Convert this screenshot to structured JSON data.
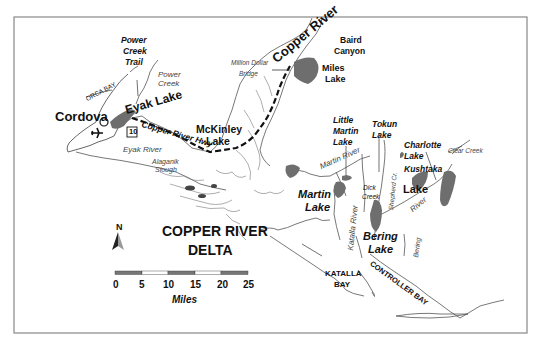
{
  "map": {
    "title": "COPPER RIVER DELTA",
    "title_line1": "COPPER RIVER",
    "title_line2": "DELTA",
    "north_arrow": "N",
    "scale_bar": {
      "ticks": [
        "0",
        "5",
        "10",
        "15",
        "20",
        "25"
      ],
      "unit": "Miles",
      "segment_colors": [
        "#777777",
        "#ffffff",
        "#777777",
        "#ffffff",
        "#777777"
      ]
    },
    "places": {
      "cordova": "Cordova",
      "eyak_lake": "Eyak Lake",
      "orca_bay": "ORCA BAY",
      "power_creek_trail_1": "Power",
      "power_creek_trail_2": "Creek",
      "power_creek_trail_3": "Trail",
      "power_creek_1": "Power",
      "power_creek_2": "Creek",
      "copper_river": "Copper River",
      "baird_canyon_1": "Baird",
      "baird_canyon_2": "Canyon",
      "million_dollar_bridge_1": "Million Dollar",
      "million_dollar_bridge_2": "Bridge",
      "miles_lake_1": "Miles",
      "miles_lake_2": "Lake",
      "mckinley_lake_1": "McKinley",
      "mckinley_lake_2": "Lake",
      "highway_number": "10",
      "copper_river_hwy": "Copper River Hwy",
      "eyak_river": "Eyak River",
      "alaganik_slough_1": "Alaganik",
      "alaganik_slough_2": "Slough",
      "little_martin_lake_1": "Little",
      "little_martin_lake_2": "Martin",
      "little_martin_lake_3": "Lake",
      "tokun_lake_1": "Tokun",
      "tokun_lake_2": "Lake",
      "charlotte_lake_1": "Charlotte",
      "charlotte_lake_2": "Lake",
      "clear_creek": "Clear Creek",
      "martin_river": "Martin River",
      "kushtaka_lake_1": "Kushtaka",
      "kushtaka_lake_2": "Lake",
      "martin_lake_1": "Martin",
      "martin_lake_2": "Lake",
      "dick_creek_1": "Dick",
      "dick_creek_2": "Creek",
      "shepherd_creek": "Shepherd Cr.",
      "river_label": "River",
      "katalla_river": "Katalla River",
      "bering_lake_1": "Bering",
      "bering_lake_2": "Lake",
      "bering_river": "Bering",
      "katalla_bay_1": "KATALLA",
      "katalla_bay_2": "BAY",
      "controller_bay": "CONTROLLER BAY"
    },
    "colors": {
      "lake_fill": "#6e6e6e",
      "coast": "#555555",
      "frame": "#888888",
      "road": "#111111"
    }
  }
}
